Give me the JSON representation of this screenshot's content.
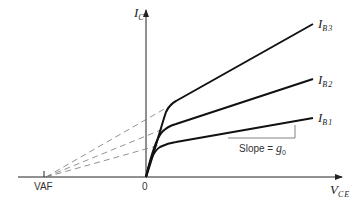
{
  "diagram": {
    "y_axis": {
      "label": "I",
      "subscript": "C"
    },
    "x_axis": {
      "label": "V",
      "subscript": "CE"
    },
    "origin_label": "0",
    "early_voltage_label": "VAF",
    "curves": [
      {
        "label": "I",
        "subscript": "B3"
      },
      {
        "label": "I",
        "subscript": "B2"
      },
      {
        "label": "I",
        "subscript": "B1"
      }
    ],
    "slope_annotation": {
      "text": "Slope = ",
      "symbol": "g",
      "symbol_sub": "0"
    },
    "colors": {
      "curve": "#111111",
      "axis": "#222222",
      "dashed": "#777777",
      "slope_triangle": "#666666"
    }
  }
}
